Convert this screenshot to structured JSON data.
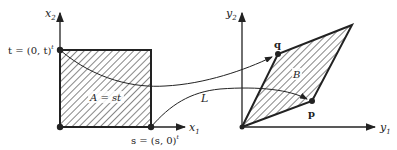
{
  "left_plot": {
    "x_axis_label": "x",
    "x_axis_sub": "1",
    "y_axis_label": "x",
    "y_axis_sub": "2",
    "point_t": "t = (0, t)",
    "point_t_sup": "t",
    "point_s": "s = (s, 0)",
    "point_s_sup": "t",
    "area_label": "A = st"
  },
  "right_plot": {
    "x_axis_label": "y",
    "x_axis_sub": "1",
    "y_axis_label": "y",
    "y_axis_sub": "2",
    "point_q": "q",
    "point_p": "p",
    "area_label": "B"
  },
  "map_label": "L",
  "colors": {
    "ink": "#222222",
    "background": "#ffffff"
  }
}
